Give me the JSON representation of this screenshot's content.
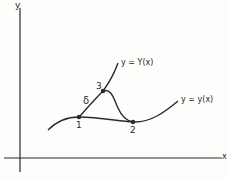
{
  "axes": {
    "x_label": "x",
    "y_label": "y"
  },
  "curves": {
    "upper_label": "y = Y(x)",
    "lower_label": "y = y(x)"
  },
  "points": [
    {
      "label": "1"
    },
    {
      "label": "2"
    },
    {
      "label": "3"
    }
  ],
  "annotations": {
    "variation": "δ"
  },
  "colors": {
    "ink": "#2a2a2a",
    "background": "#fdfdfc"
  }
}
